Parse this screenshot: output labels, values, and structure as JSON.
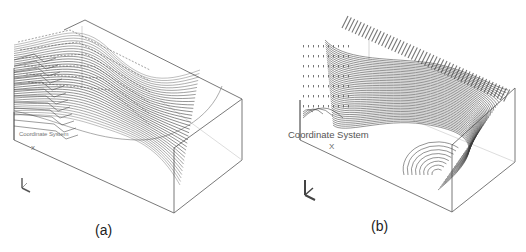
{
  "figure": {
    "panels": [
      {
        "id": "a",
        "caption": "(a)",
        "coordinate_label": "Coordinate System",
        "axis_x_label": "X",
        "triad_axes": [
          "Z",
          "Y",
          "X"
        ],
        "description": "3D box domain with dense streamlines flowing across a curved free surface"
      },
      {
        "id": "b",
        "caption": "(b)",
        "coordinate_label": "Coordinate System",
        "axis_x_label": "X",
        "triad_axes": [
          "Z",
          "Y",
          "X"
        ],
        "description": "3D box domain with velocity vectors and contour-like streamlines over a curved surface"
      }
    ],
    "colors": {
      "background": "#ffffff",
      "line": "#3a3a3a",
      "box_edge": "#666666",
      "text": "#222222"
    }
  }
}
